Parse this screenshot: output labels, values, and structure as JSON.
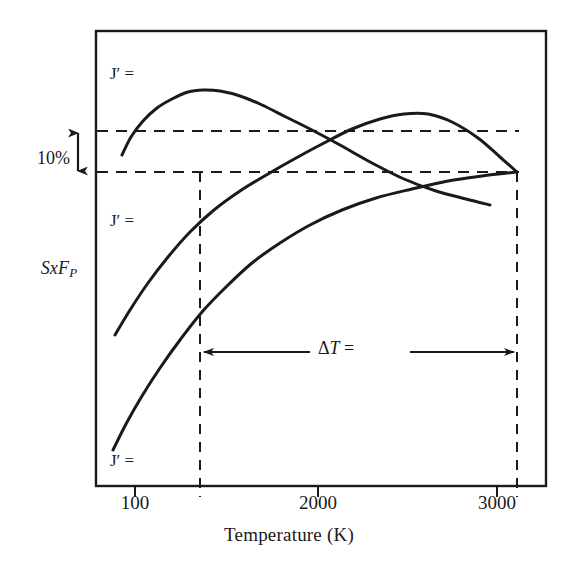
{
  "figure": {
    "background_color": "#ffffff",
    "ink_color": "#1a1a1a"
  },
  "axes": {
    "x_title": "Temperature (K)",
    "y_title_main": "SxF",
    "y_title_sub": "P",
    "x_tick_labels": [
      "100",
      "2000",
      "3000"
    ],
    "frame": {
      "left": 96,
      "right": 546,
      "top": 31,
      "bottom": 486
    }
  },
  "annotations": {
    "percent_label": "10%",
    "delta_symbol": "Δ",
    "delta_var": "T",
    "delta_equals": "=",
    "delta_t_label": "ΔT =",
    "curve_labels": [
      "J′ =",
      "J′ =",
      "J′ ="
    ],
    "curve_label_j": "J",
    "curve_label_prime": "′",
    "curve_label_equals": "="
  },
  "chart_data": {
    "type": "line",
    "title": "",
    "xlabel": "Temperature (K)",
    "ylabel": "SxF_P",
    "grid": false,
    "legend": "none",
    "xlim": [
      0,
      3400
    ],
    "ylim": [
      0,
      1
    ],
    "x_ticks": [
      {
        "label": "100",
        "pixel_x": 135
      },
      {
        "label": "2000",
        "pixel_x": 318
      },
      {
        "label": "3000",
        "pixel_x": 497
      }
    ],
    "reference_lines": {
      "horizontal": [
        {
          "name": "upper-dashed-line",
          "pixel_y": 131,
          "style": "dashed",
          "x_from": 96,
          "x_to": 517
        },
        {
          "name": "lower-dashed-line",
          "pixel_y": 172,
          "style": "dashed",
          "x_from": 96,
          "x_to": 517
        }
      ],
      "vertical": [
        {
          "name": "left-dashed-line",
          "pixel_x": 200,
          "style": "dashed",
          "y_from": 172,
          "y_to": 497
        },
        {
          "name": "right-dashed-line",
          "pixel_x": 517,
          "style": "dashed",
          "y_from": 172,
          "y_to": 497
        }
      ]
    },
    "measurements": {
      "percent_bracket": {
        "label": "10%",
        "pixel_y_top": 131,
        "pixel_y_bottom": 172,
        "pixel_x": 78
      },
      "delta_t_span": {
        "label": "ΔT =",
        "pixel_x_from": 200,
        "pixel_x_to": 517,
        "pixel_y": 352
      }
    },
    "series": [
      {
        "name": "J-prime-curve-top",
        "label": "J′ =",
        "label_pixel": [
          110,
          75
        ],
        "points": [
          [
            122,
            155
          ],
          [
            131,
            137
          ],
          [
            143,
            121
          ],
          [
            157,
            108
          ],
          [
            172,
            99
          ],
          [
            188,
            92
          ],
          [
            203,
            90
          ],
          [
            220,
            91
          ],
          [
            240,
            96
          ],
          [
            262,
            105
          ],
          [
            286,
            117
          ],
          [
            312,
            130
          ],
          [
            340,
            145
          ],
          [
            372,
            163
          ],
          [
            404,
            179
          ],
          [
            436,
            191
          ],
          [
            466,
            199
          ],
          [
            490,
            205
          ]
        ]
      },
      {
        "name": "J-prime-curve-middle",
        "label": "J′ =",
        "label_pixel": [
          110,
          222
        ],
        "points": [
          [
            115,
            335
          ],
          [
            130,
            310
          ],
          [
            148,
            283
          ],
          [
            168,
            257
          ],
          [
            190,
            232
          ],
          [
            214,
            210
          ],
          [
            240,
            191
          ],
          [
            268,
            174
          ],
          [
            296,
            158
          ],
          [
            324,
            143
          ],
          [
            352,
            129
          ],
          [
            380,
            119
          ],
          [
            404,
            114
          ],
          [
            428,
            114
          ],
          [
            452,
            122
          ],
          [
            478,
            138
          ],
          [
            500,
            157
          ],
          [
            517,
            172
          ]
        ]
      },
      {
        "name": "J-prime-curve-bottom",
        "label": "J′ =",
        "label_pixel": [
          110,
          462
        ],
        "points": [
          [
            113,
            450
          ],
          [
            126,
            424
          ],
          [
            142,
            396
          ],
          [
            160,
            368
          ],
          [
            180,
            340
          ],
          [
            202,
            312
          ],
          [
            226,
            287
          ],
          [
            252,
            263
          ],
          [
            280,
            243
          ],
          [
            310,
            225
          ],
          [
            342,
            210
          ],
          [
            376,
            198
          ],
          [
            412,
            189
          ],
          [
            448,
            181
          ],
          [
            482,
            176
          ],
          [
            517,
            172
          ]
        ]
      }
    ]
  }
}
